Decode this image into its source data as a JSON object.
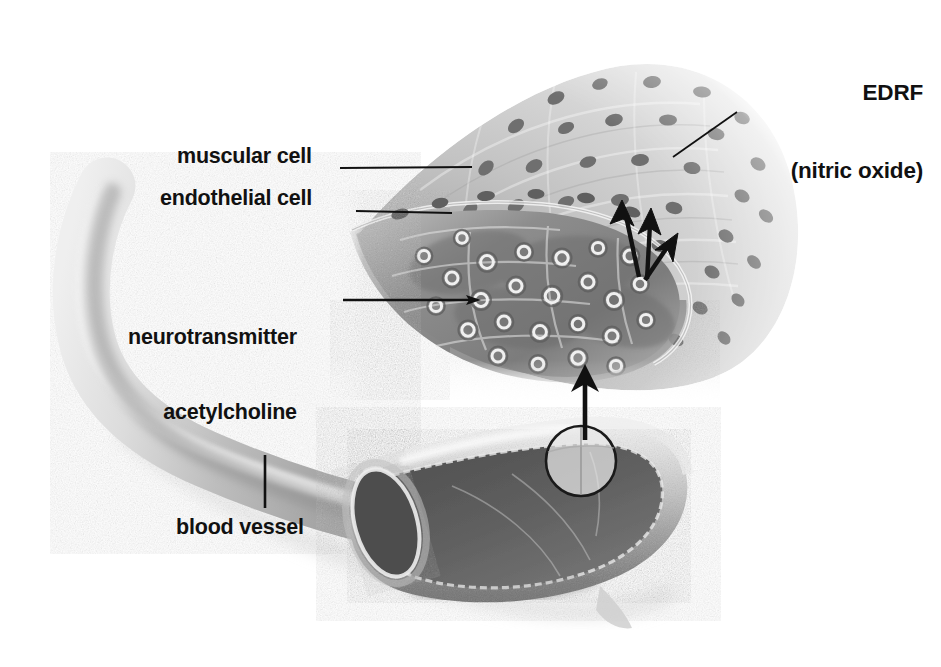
{
  "figure": {
    "title_hidden": "",
    "background_color": "#ffffff",
    "ink_color": "#111111"
  },
  "labels": {
    "edrf": {
      "line1": "EDRF",
      "line2": "(nitric oxide)",
      "x": 723,
      "y": 28
    },
    "muscular_cell": {
      "text": "muscular cell",
      "x": 177,
      "y": 144
    },
    "endothelial_cell": {
      "text": "endothelial cell",
      "x": 160,
      "y": 186
    },
    "neurotransmitter": {
      "line1": "neurotransmitter",
      "line2": "acetylcholine",
      "x": 128,
      "y": 275
    },
    "blood_vessel": {
      "text": "blood vessel",
      "x": 176,
      "y": 515
    }
  },
  "leader_lines": [
    {
      "name": "muscular-cell-leader",
      "x1": 340,
      "y1": 168,
      "x2": 472,
      "y2": 167
    },
    {
      "name": "endothelial-cell-leader",
      "x1": 356,
      "y1": 211,
      "x2": 452,
      "y2": 213
    },
    {
      "name": "acetylcholine-leader",
      "x1": 343,
      "y1": 300,
      "x2": 479,
      "y2": 300
    },
    {
      "name": "edrf-leader",
      "x1": 737,
      "y1": 112,
      "x2": 673,
      "y2": 157
    },
    {
      "name": "blood-vessel-leader",
      "x1": 265,
      "y1": 455,
      "x2": 265,
      "y2": 508
    }
  ],
  "arrows": {
    "magnification": {
      "name": "magnification-arrow",
      "from_x": 585,
      "from_y": 438,
      "to_x": 585,
      "to_y": 368,
      "meaning": "callout from circled region on vessel to magnified tissue wedge"
    },
    "edrf_release": [
      {
        "name": "edrf-arrow-left",
        "from_x": 639,
        "from_y": 277,
        "to_x": 623,
        "to_y": 206
      },
      {
        "name": "edrf-arrow-middle",
        "from_x": 647,
        "from_y": 279,
        "to_x": 651,
        "to_y": 214
      },
      {
        "name": "edrf-arrow-right",
        "from_x": 645,
        "from_y": 280,
        "to_x": 674,
        "to_y": 239
      }
    ]
  },
  "callout_circle": {
    "name": "magnification-circle",
    "cx": 581,
    "cy": 461,
    "r": 35
  },
  "anatomy": {
    "blood_vessel": {
      "name": "blood-vessel",
      "description": "S-curved cut-away vessel, light grey wall, dark lumen"
    },
    "tissue_wedge": {
      "name": "tissue-wedge",
      "description": "fan-shaped magnified vessel wall section",
      "endothelial_layer": "dark band with pale ring vesicles (acetylcholine)",
      "muscular_layer": "pale band with dark oval nuclei arranged radially"
    }
  },
  "colors": {
    "vessel_light": "#dcdcdc",
    "vessel_mid": "#b4b4b4",
    "vessel_dark": "#6e6e6e",
    "lumen": "#5a5a5a",
    "tissue_pale": "#d4d4d4",
    "tissue_dark": "#8a8a8a",
    "nucleus": "#6b6b6b",
    "ink": "#111111"
  }
}
